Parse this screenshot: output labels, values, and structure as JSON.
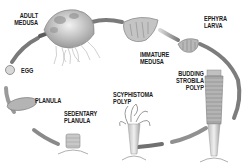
{
  "diagram": {
    "stages": [
      {
        "id": "adult-medusa",
        "lines": [
          "ADULT",
          "MEDUSA"
        ]
      },
      {
        "id": "immature-medusa",
        "lines": [
          "IMMATURE",
          "MEDUSA"
        ]
      },
      {
        "id": "ephyra-larva",
        "lines": [
          "EPHYRA",
          "LARVA"
        ]
      },
      {
        "id": "budding-strobila-polyp",
        "lines": [
          "BUDDING",
          "STROBILA",
          "POLYP"
        ]
      },
      {
        "id": "scyphistoma-polyp",
        "lines": [
          "SCYPHISTOMA",
          "POLYP"
        ]
      },
      {
        "id": "sedentary-planula",
        "lines": [
          "SEDENTARY",
          "PLANULA"
        ]
      },
      {
        "id": "planula",
        "lines": [
          "PLANULA"
        ]
      },
      {
        "id": "egg",
        "lines": [
          "EGG"
        ]
      }
    ],
    "colors": {
      "arrow": "#8a8a8a",
      "arrow_light": "#c8c8c8",
      "organism": "#a0a0a0",
      "label": "#1a1a1a",
      "background": "#ffffff"
    }
  }
}
